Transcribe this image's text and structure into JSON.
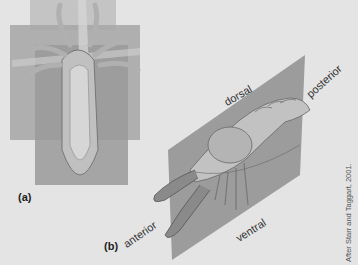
{
  "figure": {
    "panels": [
      {
        "id": "a",
        "label": "(a)",
        "subject": "radially symmetric animal with intersecting planes"
      },
      {
        "id": "b",
        "label": "(b)",
        "subject": "bilaterally symmetric crayfish with sagittal plane"
      }
    ],
    "orientation_labels": {
      "dorsal": "dorsal",
      "posterior": "posterior",
      "anterior": "anterior",
      "ventral": "ventral"
    },
    "credit": "After Starr and Taggart, 2001.",
    "colors": {
      "background": "#e4e4e4",
      "plane": "#9a9a9a",
      "plane_light": "#b8b8b8",
      "organism": "#c8c8c8",
      "organism_dark": "#7e7e7e",
      "text": "#333333"
    }
  }
}
